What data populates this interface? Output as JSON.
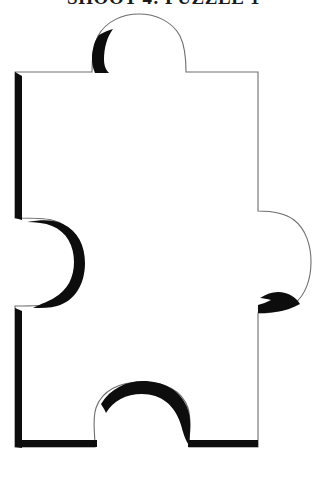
{
  "page": {
    "background_color": "#ffffff",
    "width": 327,
    "height": 477
  },
  "header": {
    "title": "SHOOT 4: PUZZLE 1",
    "title_color": "#1a1a1a",
    "cropped": "true"
  },
  "figure": {
    "name": "puzzle-piece",
    "caption": "",
    "outline_color": "#6e6e6e",
    "shadow_color": "#0d0d0d",
    "fill_color": "#ffffff",
    "edges": {
      "top": "tab",
      "right": "tab",
      "bottom": "blank",
      "left": "blank"
    },
    "body_bounds": {
      "left": 14,
      "top": 72,
      "right": 258,
      "bottom": 447
    }
  }
}
